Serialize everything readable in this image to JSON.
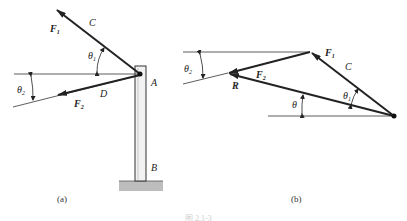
{
  "figure": {
    "caption": "图 2.1-3",
    "panel_a": {
      "label": "(a)",
      "points": {
        "A": "A",
        "B": "B",
        "C": "C",
        "D": "D"
      },
      "forces": {
        "F1": {
          "sym": "F",
          "sub": "1"
        },
        "F2": {
          "sym": "F",
          "sub": "2"
        }
      },
      "angles": {
        "theta1": {
          "sym": "θ",
          "sub": "1"
        },
        "theta2": {
          "sym": "θ",
          "sub": "2"
        }
      }
    },
    "panel_b": {
      "label": "(b)",
      "points": {
        "C": "C"
      },
      "forces": {
        "F1": {
          "sym": "F",
          "sub": "1"
        },
        "F2": {
          "sym": "F",
          "sub": "2"
        },
        "R": "R"
      },
      "angles": {
        "theta": "θ",
        "theta1": {
          "sym": "θ",
          "sub": "1"
        },
        "theta2": {
          "sym": "θ",
          "sub": "2"
        }
      }
    }
  }
}
